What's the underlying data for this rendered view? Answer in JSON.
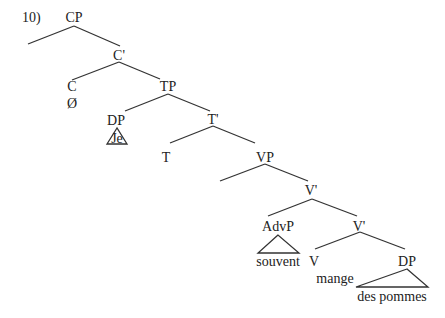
{
  "example_number": "10)",
  "colors": {
    "line": "#333333",
    "text": "#222222",
    "background": "#ffffff"
  },
  "nodes": [
    {
      "id": "cp",
      "label": "CP",
      "x": 74,
      "y": 18
    },
    {
      "id": "cbar",
      "label": "C'",
      "x": 119,
      "y": 56
    },
    {
      "id": "c",
      "label": "C",
      "x": 72,
      "y": 87
    },
    {
      "id": "c-null",
      "label": "Ø",
      "x": 72,
      "y": 104
    },
    {
      "id": "tp",
      "label": "TP",
      "x": 168,
      "y": 87
    },
    {
      "id": "dp-subj",
      "label": "DP",
      "x": 116,
      "y": 121
    },
    {
      "id": "je",
      "label": "Je",
      "x": 117,
      "y": 139
    },
    {
      "id": "tbar",
      "label": "T'",
      "x": 213,
      "y": 120
    },
    {
      "id": "t",
      "label": "T",
      "x": 166,
      "y": 158
    },
    {
      "id": "vp",
      "label": "VP",
      "x": 265,
      "y": 158
    },
    {
      "id": "vbar-1",
      "label": "V'",
      "x": 311,
      "y": 191
    },
    {
      "id": "advp",
      "label": "AdvP",
      "x": 278,
      "y": 227
    },
    {
      "id": "souvent",
      "label": "souvent",
      "x": 278,
      "y": 262
    },
    {
      "id": "vbar-2",
      "label": "V'",
      "x": 359,
      "y": 227
    },
    {
      "id": "v",
      "label": "V",
      "x": 314,
      "y": 262
    },
    {
      "id": "mange",
      "label": "mange",
      "x": 335,
      "y": 279
    },
    {
      "id": "dp-obj",
      "label": "DP",
      "x": 407,
      "y": 262
    },
    {
      "id": "des-pommes",
      "label": "des pommes",
      "x": 392,
      "y": 297
    }
  ],
  "edges": [
    [
      74,
      26,
      28,
      44
    ],
    [
      74,
      26,
      120,
      46
    ],
    [
      119,
      62,
      72,
      80
    ],
    [
      119,
      62,
      160,
      79
    ],
    [
      168,
      94,
      125,
      111
    ],
    [
      168,
      94,
      210,
      111
    ],
    [
      213,
      126,
      170,
      143
    ],
    [
      213,
      126,
      255,
      143
    ],
    [
      265,
      164,
      220,
      181
    ],
    [
      265,
      164,
      308,
      181
    ],
    [
      312,
      199,
      268,
      216
    ],
    [
      312,
      199,
      357,
      216
    ],
    [
      360,
      232,
      315,
      249
    ],
    [
      360,
      232,
      405,
      249
    ]
  ],
  "triangles": [
    {
      "name": "dp-subj-triangle",
      "points": "117,128 107,144 127,144"
    },
    {
      "name": "advp-triangle",
      "points": "278,235 258,253 299,253"
    },
    {
      "name": "dp-obj-triangle",
      "points": "407,269 356,287 428,287"
    }
  ]
}
